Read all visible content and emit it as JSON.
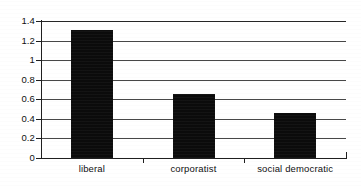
{
  "chart_data": {
    "type": "bar",
    "title": "",
    "xlabel": "",
    "ylabel": "",
    "categories": [
      "liberal",
      "corporatist",
      "social democratic"
    ],
    "values": [
      1.31,
      0.65,
      0.46
    ],
    "ylim": [
      0,
      1.4
    ],
    "ytick_values": [
      0,
      0.2,
      0.4,
      0.6,
      0.8,
      1.0,
      1.2,
      1.4
    ],
    "ytick_labels": [
      "0",
      "0.2",
      "0.4",
      "0.6",
      "0.8",
      "1",
      "1.2",
      "1.4"
    ],
    "grid": true,
    "grid_axis": "y",
    "legend": false,
    "legend_position": "none",
    "bar_color": "#0b0b0b",
    "axis_color": "#1f1f1f",
    "background": "#ffffff"
  }
}
